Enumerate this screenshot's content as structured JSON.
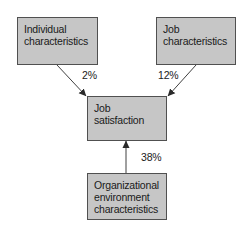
{
  "diagram": {
    "nodes": [
      {
        "id": "individual",
        "lines": [
          "Individual",
          "characteristics"
        ]
      },
      {
        "id": "job",
        "lines": [
          "Job",
          "characteristics"
        ]
      },
      {
        "id": "satisfaction",
        "lines": [
          "Job",
          "satisfaction"
        ]
      },
      {
        "id": "organizational",
        "lines": [
          "Organizational",
          "environment",
          "characteristics"
        ]
      }
    ],
    "edges": [
      {
        "from": "individual",
        "to": "satisfaction",
        "label": "2%"
      },
      {
        "from": "job",
        "to": "satisfaction",
        "label": "12%"
      },
      {
        "from": "organizational",
        "to": "satisfaction",
        "label": "38%"
      }
    ],
    "colors": {
      "box_fill": "#c6c6c6",
      "box_border": "#505050",
      "arrow": "#2a2a2a",
      "text": "#1a1a1a"
    }
  }
}
